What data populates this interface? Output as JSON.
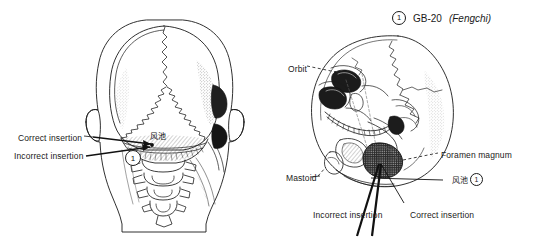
{
  "figure": {
    "background_color": "#ffffff",
    "ink_color": "#1a1a1a",
    "style": "black-and-white anatomical line drawing"
  },
  "header": {
    "marker": "1",
    "point_code": "GB-20",
    "point_name_italic": "(Fengchi)"
  },
  "panels": [
    {
      "id": "left-panel",
      "view": "posterior view of head and skull with cervical vertebrae",
      "marker": "1",
      "cjk_label": "风池",
      "labels": [
        {
          "name": "correct-insertion",
          "text": "Correct insertion",
          "x": 18,
          "y": 133
        },
        {
          "name": "incorrect-insertion",
          "text": "Incorrect insertion",
          "x": 14,
          "y": 151
        }
      ]
    },
    {
      "id": "right-panel",
      "view": "tilted skull viewed from below showing base of cranium",
      "marker": "1",
      "cjk_label": "风池",
      "labels": [
        {
          "name": "orbit",
          "text": "Orbit",
          "x": 288,
          "y": 64
        },
        {
          "name": "foramen-magnum",
          "text": "Foramen magnum",
          "x": 441,
          "y": 150
        },
        {
          "name": "mastoid",
          "text": "Mastoid",
          "x": 286,
          "y": 173
        },
        {
          "name": "incorrect-insertion",
          "text": "Incorrect insertion",
          "x": 313,
          "y": 210
        },
        {
          "name": "correct-insertion",
          "text": "Correct insertion",
          "x": 410,
          "y": 210
        }
      ]
    }
  ]
}
